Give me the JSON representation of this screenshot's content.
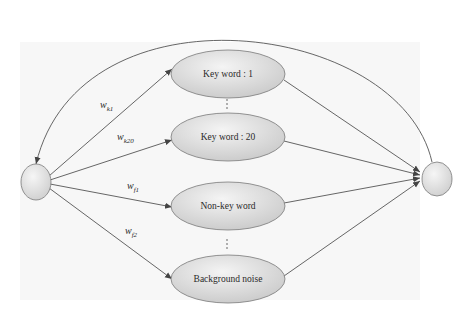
{
  "diagram": {
    "type": "state-transition-network",
    "start_node": {
      "label": ""
    },
    "end_node": {
      "label": ""
    },
    "states": [
      {
        "id": "kw1",
        "label": "Key word : 1"
      },
      {
        "id": "kw20",
        "label": "Key word : 20"
      },
      {
        "id": "nonkw",
        "label": "Non-key word"
      },
      {
        "id": "bg",
        "label": "Background noise"
      }
    ],
    "ellipsis_between": [
      [
        "kw1",
        "kw20"
      ],
      [
        "nonkw",
        "bg"
      ]
    ],
    "weights": [
      {
        "to": "kw1",
        "base": "w",
        "sub": "k1"
      },
      {
        "to": "kw20",
        "base": "w",
        "sub": "k20"
      },
      {
        "to": "nonkw",
        "base": "w",
        "sub": "f1"
      },
      {
        "to": "bg",
        "base": "w",
        "sub": "f2"
      }
    ],
    "edges": [
      {
        "from": "start",
        "to": "kw1"
      },
      {
        "from": "start",
        "to": "kw20"
      },
      {
        "from": "start",
        "to": "nonkw"
      },
      {
        "from": "start",
        "to": "bg"
      },
      {
        "from": "kw1",
        "to": "end"
      },
      {
        "from": "kw20",
        "to": "end"
      },
      {
        "from": "nonkw",
        "to": "end"
      },
      {
        "from": "bg",
        "to": "end"
      },
      {
        "from": "end",
        "to": "start",
        "style": "loop-back-arc"
      }
    ],
    "colors": {
      "node_fill_light": "#f4f4f4",
      "node_fill_dark": "#c9c9c9",
      "node_stroke": "#7a7a7a",
      "edge": "#555555",
      "scan_background": "#f6f6f6"
    }
  }
}
